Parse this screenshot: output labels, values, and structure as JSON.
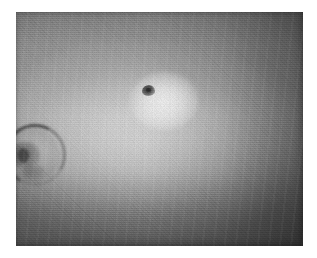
{
  "page": {
    "kind": "photograph",
    "background_color": "#ffffff",
    "width": 317,
    "height": 258
  },
  "photo": {
    "name": "grayscale-clinical-photograph",
    "alt_text": "Grainy black-and-white close-up photograph of skin showing a small dark central lesion surrounded by a bright halo, with a partially cropped ear at the left edge",
    "frame": {
      "left": 16,
      "top": 12,
      "width": 287,
      "height": 234
    },
    "tone": {
      "highlight_color": "#d8d8d8",
      "midtone_color": "#b0b0b0",
      "shadow_color": "#6e6e6e",
      "corner_top_left": "#c8c8c8",
      "corner_top_right": "#757575",
      "corner_bottom_left": "#707070",
      "corner_bottom_right": "#6e6e6e",
      "center_bright": "#d2d2d2"
    },
    "grain": {
      "present": true,
      "description": "heavy halftone film grain, coarser toward the lower edge"
    }
  },
  "features": [
    {
      "name": "central-lesion",
      "label": "dark central lesion with bright halo",
      "center_x": 148,
      "center_y": 90,
      "core_width": 13,
      "core_height": 11,
      "core_color": "#303030",
      "halo_diameter": 68,
      "halo_color": "#ffffff"
    },
    {
      "name": "ear-at-left-edge",
      "label": "partially cropped ear",
      "left": 2,
      "top": 124,
      "width": 48,
      "height": 60,
      "rim_color": "#383838",
      "inner_shadow_color": "#3a3a3a"
    }
  ],
  "caption": {
    "text": ""
  }
}
